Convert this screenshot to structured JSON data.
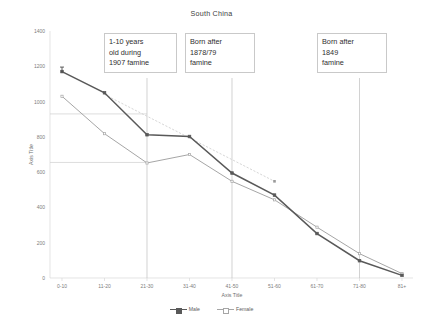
{
  "chart_data": {
    "type": "line",
    "title": "South China",
    "xlabel": "Axis Title",
    "ylabel": "Axis Title",
    "categories": [
      "0-10",
      "11-20",
      "21-30",
      "31-40",
      "41-50",
      "51-60",
      "61-70",
      "71-80",
      "81+"
    ],
    "ylim": [
      0,
      1400
    ],
    "yticks": [
      0,
      200,
      400,
      600,
      800,
      1000,
      1200,
      1400
    ],
    "grid": false,
    "legend_position": "bottom",
    "series": [
      {
        "name": "Male",
        "color": "#595959",
        "marker": "square-filled",
        "values": [
          1170,
          1050,
          812,
          802,
          595,
          470,
          252,
          98,
          15
        ]
      },
      {
        "name": "Female",
        "color": "#a6a6a6",
        "marker": "square-open",
        "values": [
          1030,
          818,
          652,
          700,
          548,
          443,
          288,
          138,
          25
        ]
      }
    ],
    "trend_line": {
      "name": "trend",
      "color": "#cccccc",
      "style": "dotted",
      "from_category": "11-20",
      "to_category": "51-60",
      "from_value": 1040,
      "to_value": 548
    },
    "reference_lines": [
      {
        "name": "upper-reference",
        "value": 930,
        "from_category": "0-10",
        "to_category": "21-30"
      },
      {
        "name": "lower-reference",
        "value": 655,
        "from_category": "0-10",
        "to_category": "21-30"
      }
    ],
    "annotations": [
      {
        "id": "famine-1907",
        "lines": [
          "1-10 years",
          "old during",
          "1907 famine"
        ],
        "callout_category": "21-30"
      },
      {
        "id": "famine-1878-79",
        "lines": [
          "Born after",
          "1878/79",
          "famine"
        ],
        "callout_category": "41-50"
      },
      {
        "id": "famine-1849",
        "lines": [
          "Born after",
          "1849",
          "famine"
        ],
        "callout_category": "71-80"
      }
    ]
  }
}
